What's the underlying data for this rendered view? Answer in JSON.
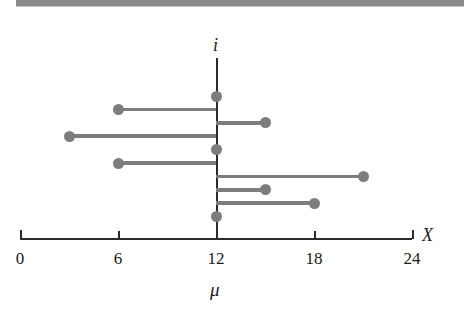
{
  "figure": {
    "width": 464,
    "height": 317,
    "background": "#ffffff",
    "banner_color": "#8a8a8a"
  },
  "chart_data": {
    "type": "scatter",
    "title": "",
    "subtitle": "",
    "xlabel": "X",
    "ylabel": "i",
    "mean_label": "μ",
    "mean_value": 12,
    "xlim": [
      0,
      24
    ],
    "xticks": [
      0,
      6,
      12,
      18,
      24
    ],
    "xticklabels": [
      "0",
      "6",
      "12",
      "18",
      "24"
    ],
    "grid": false,
    "legend": null,
    "series_color": "#7d7d7d",
    "axis_color": "#2b2b2b",
    "intervals": [
      {
        "index": 1,
        "lower": 12,
        "upper": 12,
        "covers_mu": true
      },
      {
        "index": 2,
        "lower": 6,
        "upper": 12,
        "covers_mu": true
      },
      {
        "index": 3,
        "lower": 12,
        "upper": 15,
        "covers_mu": true
      },
      {
        "index": 4,
        "lower": 3,
        "upper": 12,
        "covers_mu": true
      },
      {
        "index": 5,
        "lower": 12,
        "upper": 12,
        "covers_mu": true
      },
      {
        "index": 6,
        "lower": 6,
        "upper": 12,
        "covers_mu": true
      },
      {
        "index": 7,
        "lower": 12,
        "upper": 21,
        "covers_mu": true
      },
      {
        "index": 8,
        "lower": 12,
        "upper": 15,
        "covers_mu": true
      },
      {
        "index": 9,
        "lower": 12,
        "upper": 18,
        "covers_mu": true
      },
      {
        "index": 10,
        "lower": 12,
        "upper": 12,
        "covers_mu": true
      }
    ]
  }
}
